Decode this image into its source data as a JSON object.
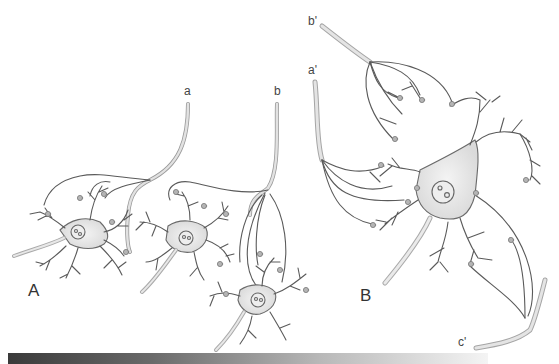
{
  "figure": {
    "panels": [
      {
        "id": "A",
        "label": "A",
        "description": "Convergence: two incoming axons (a and b) synapse onto multiple neurons",
        "axon_labels": [
          "a",
          "b"
        ],
        "neuron_count": 3
      },
      {
        "id": "B",
        "label": "B",
        "description": "Divergence onto a single neuron receiving axons a', b', c'",
        "axon_labels": [
          "a'",
          "b'",
          "c'"
        ],
        "neuron_count": 1
      }
    ],
    "colors": {
      "line": "#5a5a5a",
      "soma_fill": "#e6e6e6",
      "axon_fill": "#dcdcdc",
      "terminal_fill": "#b5b5b5",
      "background": "#ffffff"
    }
  }
}
